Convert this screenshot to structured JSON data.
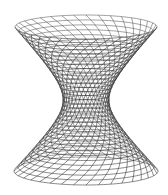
{
  "figure": {
    "width": 168,
    "height": 195,
    "background": "#ffffff",
    "line_color": "#2a2a2a",
    "back_line_color": "#555555",
    "line_width": 0.55,
    "center_x": 86,
    "top_y": 27,
    "bottom_y": 171,
    "waist_y": 100,
    "top_rx": 71,
    "top_ry": 12,
    "bottom_rx": 72,
    "bottom_ry": 14,
    "waist_rx": 23,
    "meridians": 36,
    "parallels": 34,
    "twist_deg": 70
  }
}
